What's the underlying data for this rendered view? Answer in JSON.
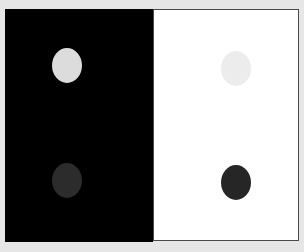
{
  "figure": {
    "title": "",
    "background_color": "#e6e6e6",
    "left_panel": {
      "background_color": "#000000"
    },
    "right_panel": {
      "top_cell": {
        "background_color": "#ffffff"
      },
      "bottom_cell": {
        "background_color": "#ffffff"
      },
      "border_color": "#3a3a3a"
    },
    "discs": [
      {
        "id": "top-left",
        "color": "#dcdcdc",
        "on": "black"
      },
      {
        "id": "top-right",
        "color": "#ececec",
        "on": "white"
      },
      {
        "id": "bottom-left",
        "color": "#2c2c2c",
        "on": "black"
      },
      {
        "id": "bottom-right",
        "color": "#262626",
        "on": "white"
      }
    ]
  }
}
